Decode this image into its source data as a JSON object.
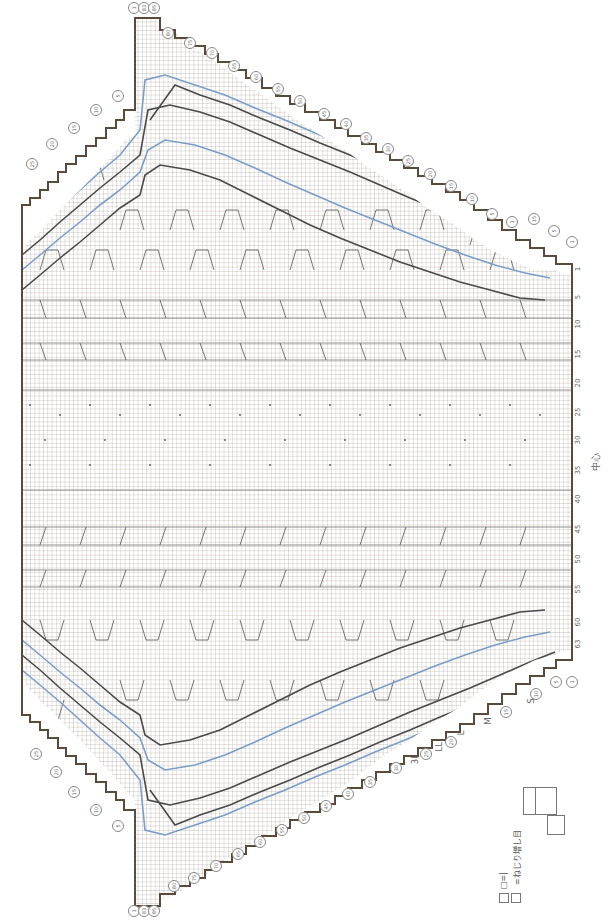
{
  "chart": {
    "type": "knitting-chart",
    "orientation": "rotated-90-ccw",
    "stitch_columns": {
      "labels": [
        "1",
        "5",
        "10",
        "15",
        "20",
        "25",
        "30",
        "35",
        "40",
        "45",
        "50",
        "55",
        "60",
        "63"
      ],
      "center_label": "中心",
      "center_column": 32
    },
    "sizes": [
      "S",
      "M",
      "L",
      "LL",
      "3L"
    ],
    "top_edge_rows": {
      "header_marks": [
        "1",
        "83",
        "85"
      ],
      "marks": [
        "80",
        "75",
        "70",
        "65",
        "60",
        "55",
        "50",
        "45",
        "40",
        "35",
        "30",
        "25",
        "20",
        "15",
        "10",
        "5",
        "1"
      ]
    },
    "right_side_row_marks": {
      "top": [
        "1",
        "5",
        "10",
        "15",
        "20",
        "25",
        "30",
        "35",
        "40",
        "45",
        "50",
        "55",
        "60",
        "65",
        "70",
        "75",
        "80"
      ],
      "bottom": [
        "1",
        "5",
        "10",
        "15",
        "20",
        "25",
        "30",
        "35",
        "40",
        "45",
        "50",
        "55",
        "60",
        "65",
        "70",
        "75",
        "80"
      ]
    },
    "left_edge_row_marks": {
      "top": [
        "5",
        "10",
        "15",
        "20",
        "25"
      ],
      "bottom": [
        "5",
        "10",
        "15",
        "20",
        "25"
      ]
    },
    "bottom_edge_rows": {
      "header_marks": [
        "1",
        "83",
        "85"
      ],
      "marks": [
        "80",
        "75",
        "70",
        "65",
        "60",
        "55",
        "50",
        "45",
        "40",
        "35",
        "30",
        "25",
        "20",
        "15",
        "10",
        "5",
        "1"
      ]
    },
    "size_label_positions": [
      {
        "size": "S",
        "row": "10"
      },
      {
        "size": "M",
        "row": "25"
      },
      {
        "size": "L",
        "row": "30"
      },
      {
        "size": "LL",
        "row": "35"
      },
      {
        "size": "3L",
        "row": "40"
      }
    ],
    "colors": {
      "grid": "#9a9088",
      "outline": "#5a4a3c",
      "size_line_dark": "#4a4a4a",
      "size_line_blue": "#7a9ec8",
      "dot": "#555555",
      "background": "#ffffff"
    }
  },
  "legend": {
    "items": [
      {
        "symbol": "□=|",
        "label": ""
      },
      {
        "symbol": "⊠",
        "label": "=ねじり増し目"
      },
      {
        "symbol": "cable-2x2-left",
        "label": ""
      },
      {
        "symbol": "cable-2x2-right",
        "label": ""
      },
      {
        "symbol": "bobble",
        "label": ""
      }
    ]
  }
}
